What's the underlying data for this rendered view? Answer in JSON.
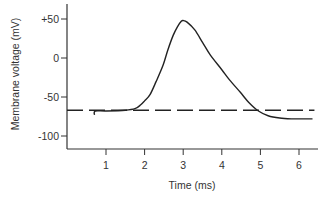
{
  "chart_data": {
    "type": "line",
    "title": "",
    "xlabel": "Time (ms)",
    "ylabel": "Membrane voltage (mV)",
    "xlim": [
      0,
      6.5
    ],
    "ylim": [
      -120,
      60
    ],
    "xticks": [
      1,
      2,
      3,
      4,
      5,
      6
    ],
    "xtick_labels": [
      "1",
      "2",
      "3",
      "4",
      "5",
      "6"
    ],
    "yticks": [
      50,
      0,
      -50,
      -100
    ],
    "ytick_labels": [
      "+50",
      "0",
      "-50",
      "-100"
    ],
    "grid": false,
    "legend": null,
    "series": [
      {
        "name": "Action potential",
        "style": "solid",
        "x": [
          0.7,
          0.72,
          1.0,
          1.5,
          1.75,
          1.9,
          2.0,
          2.14,
          2.3,
          2.48,
          2.6,
          2.74,
          2.85,
          2.95,
          3.0,
          3.1,
          3.3,
          3.5,
          3.7,
          4.0,
          4.2,
          4.48,
          4.7,
          4.95,
          5.2,
          5.5,
          5.8,
          6.1,
          6.35
        ],
        "y": [
          -73,
          -68,
          -68,
          -67,
          -65,
          -60,
          -55,
          -47,
          -30,
          -9,
          10,
          29,
          40,
          47,
          48,
          46,
          36,
          20,
          4,
          -15,
          -28,
          -44,
          -57,
          -68,
          -74,
          -77,
          -78,
          -78,
          -78
        ]
      },
      {
        "name": "Resting potential",
        "style": "dashed",
        "x": [
          0,
          6.4
        ],
        "y": [
          -67,
          -67
        ]
      }
    ]
  }
}
